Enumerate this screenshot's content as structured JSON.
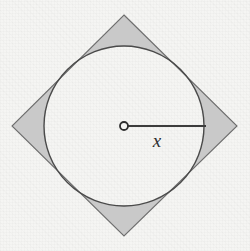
{
  "figure": {
    "caption": "",
    "background_color": "#f5f5f3",
    "stroke_color": "#4a4a4a",
    "shaded_fill_color": "#c9c9c9",
    "circle_fill_color": "#f5f5f3",
    "labels": {
      "radius": "x"
    },
    "geometry": {
      "square": {
        "name": "rotated-square",
        "rotation_degrees": 45,
        "vertices": [
          {
            "id": "top",
            "x": 124,
            "y": 15
          },
          {
            "id": "right",
            "x": 237,
            "y": 126
          },
          {
            "id": "bottom",
            "x": 124,
            "y": 236
          },
          {
            "id": "left",
            "x": 12,
            "y": 126
          }
        ],
        "half_diagonal": 112,
        "side_length": 158.4
      },
      "circle": {
        "name": "inscribed-circle",
        "center": {
          "x": 124,
          "y": 126
        },
        "radius": 80
      },
      "radius_line": {
        "from": {
          "x": 124,
          "y": 126
        },
        "to": {
          "x": 205,
          "y": 126
        },
        "label": "x"
      },
      "center_marker": {
        "x": 124,
        "y": 126,
        "radius": 4,
        "fill": "#f5f5f3"
      },
      "label_position": {
        "x": 157,
        "y": 146
      }
    }
  }
}
